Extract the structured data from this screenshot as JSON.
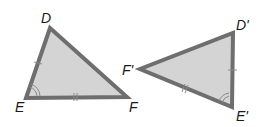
{
  "diagram": {
    "type": "congruent-triangles",
    "colors": {
      "fill": "#d4d4d4",
      "stroke": "#6e6e6e",
      "marks": "#8a8a8a",
      "labels": "#1a1a1a"
    },
    "triangles": [
      {
        "name": "DEF",
        "vertices": {
          "D": {
            "label": "D",
            "x": 50,
            "y": 28,
            "label_x": 41,
            "label_y": 23
          },
          "E": {
            "label": "E",
            "x": 26,
            "y": 98,
            "label_x": 15,
            "label_y": 112
          },
          "F": {
            "label": "F",
            "x": 127,
            "y": 97,
            "label_x": 129,
            "label_y": 112
          }
        },
        "marks": {
          "DE": "single-tick",
          "EF": "double-tick",
          "angle_E": "double-arc"
        }
      },
      {
        "name": "D'E'F'",
        "vertices": {
          "D": {
            "label": "D'",
            "x": 233,
            "y": 33,
            "label_x": 236,
            "label_y": 30
          },
          "E": {
            "label": "E'",
            "x": 232,
            "y": 107,
            "label_x": 236,
            "label_y": 121
          },
          "F": {
            "label": "F'",
            "x": 140,
            "y": 69,
            "label_x": 122,
            "label_y": 75
          }
        },
        "marks": {
          "D'E'": "single-tick",
          "F'E'": "double-tick",
          "angle_E'": "double-arc"
        }
      }
    ]
  }
}
